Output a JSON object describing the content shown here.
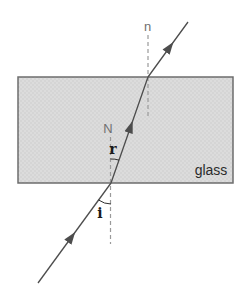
{
  "figure": {
    "labels": {
      "outer_normal": "n",
      "inner_normal": "N",
      "angle_refraction": "r",
      "angle_incidence": "i",
      "medium": "glass"
    },
    "colors": {
      "background": "#ffffff",
      "glass_fill": "#dcdcdc",
      "glass_border": "#6e6e6e",
      "ray": "#4d4d4d",
      "normal_dashed": "#9a9a9a",
      "gray_label": "#6f6f6f",
      "dark_label": "#1a1a1a"
    }
  }
}
